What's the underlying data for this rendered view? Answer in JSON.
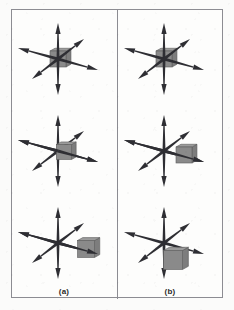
{
  "figure": {
    "title": "",
    "background_color": "#fbfbfa",
    "frame_color": "#8c8c92",
    "axis_color": "#2e2e33",
    "cube_colors": {
      "top": "#9b9b9b",
      "front": "#8a8a8a",
      "side": "#7d7d7d",
      "edge": "#5d5d5d"
    }
  },
  "panels": [
    {
      "id": "a",
      "label": "(a)",
      "scenes": [
        {
          "name": "cube-centered-at-origin",
          "cube_offset": {
            "x": 0,
            "y": 0
          },
          "cube_size": 16,
          "caption": ""
        },
        {
          "name": "cube-slightly-offset",
          "cube_offset": {
            "x": 6,
            "y": 1
          },
          "cube_size": 15,
          "caption": ""
        },
        {
          "name": "cube-translated-far-right",
          "cube_offset": {
            "x": 28,
            "y": 6
          },
          "cube_size": 17,
          "caption": ""
        }
      ]
    },
    {
      "id": "b",
      "label": "(b)",
      "scenes": [
        {
          "name": "cube-centered-at-origin",
          "cube_offset": {
            "x": 0,
            "y": 0
          },
          "cube_size": 16,
          "caption": ""
        },
        {
          "name": "cube-translated-right",
          "cube_offset": {
            "x": 20,
            "y": 4
          },
          "cube_size": 16,
          "caption": ""
        },
        {
          "name": "cube-translated-down",
          "cube_offset": {
            "x": 9,
            "y": 17
          },
          "cube_size": 19,
          "caption": ""
        }
      ]
    }
  ],
  "axes": {
    "description": "three double-headed arrows forming a 3D coordinate cross",
    "arms": [
      {
        "name": "vertical-axis",
        "dx": 0,
        "dy": -36
      },
      {
        "name": "horizontal-axis",
        "dx": 40,
        "dy": 11
      },
      {
        "name": "depth-axis",
        "dx": 26,
        "dy": -20
      }
    ]
  }
}
